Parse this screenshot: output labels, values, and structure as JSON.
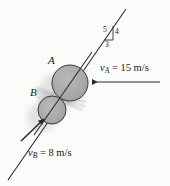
{
  "figure": {
    "type": "physics-diagram",
    "background_color": "#fbfbfa",
    "line_color": "#262626",
    "disk_fill": "#a9a9a9",
    "disk_stroke": "#3a3a3a",
    "shadow_color": "#cfcfcf"
  },
  "labels": {
    "disk_a": "A",
    "disk_b": "B",
    "velocity_a_symbol": "v",
    "velocity_a_subscript": "A",
    "velocity_a_value": " = 15 m/s",
    "velocity_b_symbol": "v",
    "velocity_b_subscript": "B",
    "velocity_b_value": " = 8 m/s"
  },
  "slope_triangle": {
    "hypotenuse": "5",
    "vertical": "4",
    "horizontal": "3"
  },
  "geometry": {
    "disk_a_center_x": 70,
    "disk_a_center_y": 83,
    "disk_a_radius": 18,
    "disk_b_center_x": 52,
    "disk_b_center_y": 110,
    "disk_b_radius": 14,
    "impact_line_x1": 8,
    "impact_line_y1": 180,
    "impact_line_x2": 126,
    "impact_line_y2": 9
  }
}
